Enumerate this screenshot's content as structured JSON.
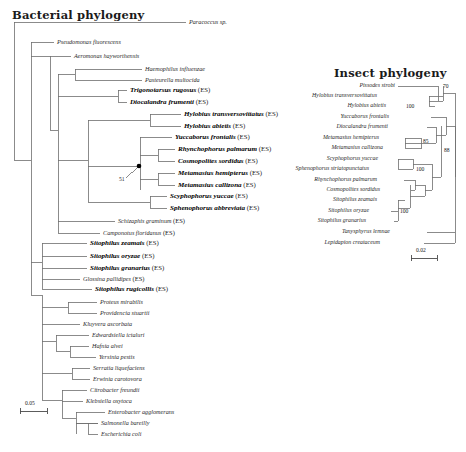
{
  "figure": {
    "bacterial": {
      "title": "Bacterial phylogeny",
      "scale": "0.05",
      "support_labels": [
        {
          "id": "n51",
          "value": "51"
        }
      ],
      "tips": [
        {
          "name": "Paracoccus sp.",
          "suffix": "",
          "bold": false,
          "x": 189,
          "y": 22
        },
        {
          "name": "Pseudomonas fluorescens",
          "suffix": "",
          "bold": false,
          "x": 57,
          "y": 42
        },
        {
          "name": "Aeromonas hayworthensis",
          "suffix": "",
          "bold": false,
          "x": 74,
          "y": 56
        },
        {
          "name": "Haemophilus influenzae",
          "suffix": "",
          "bold": false,
          "x": 145,
          "y": 69
        },
        {
          "name": "Pasteurella multocida",
          "suffix": "",
          "bold": false,
          "x": 145,
          "y": 80
        },
        {
          "name": "Trigonotarsus rugosus",
          "suffix": "(ES)",
          "bold": true,
          "x": 130,
          "y": 90
        },
        {
          "name": "Diocalandra frumenti",
          "suffix": "(ES)",
          "bold": true,
          "x": 130,
          "y": 102
        },
        {
          "name": "Hylobius transversovittatus",
          "suffix": "(ES)",
          "bold": true,
          "x": 184,
          "y": 114
        },
        {
          "name": "Hylobius abietis",
          "suffix": "(ES)",
          "bold": true,
          "x": 184,
          "y": 126
        },
        {
          "name": "Yuccaborus frontalis",
          "suffix": "(ES)",
          "bold": true,
          "x": 175,
          "y": 137
        },
        {
          "name": "Rhynchophorus palmarum",
          "suffix": "(ES)",
          "bold": true,
          "x": 178,
          "y": 149
        },
        {
          "name": "Cosmopolites sordidus",
          "suffix": "(ES)",
          "bold": true,
          "x": 178,
          "y": 161
        },
        {
          "name": "Metamasius hemipterus",
          "suffix": "(ES)",
          "bold": true,
          "x": 178,
          "y": 173
        },
        {
          "name": "Metamasius callizona",
          "suffix": "(ES)",
          "bold": true,
          "x": 178,
          "y": 185
        },
        {
          "name": "Scyphophorus yuccae",
          "suffix": "(ES)",
          "bold": true,
          "x": 170,
          "y": 196
        },
        {
          "name": "Sphenophorus abbreviata",
          "suffix": "(ES)",
          "bold": true,
          "x": 170,
          "y": 208
        },
        {
          "name": "Schizaphis graminum",
          "suffix": "(ES)",
          "bold": false,
          "x": 118,
          "y": 221
        },
        {
          "name": "Camponotus floridanus",
          "suffix": "(ES)",
          "bold": false,
          "x": 103,
          "y": 233
        },
        {
          "name": "Sitophilus zeamais",
          "suffix": "(ES)",
          "bold": true,
          "x": 90,
          "y": 243
        },
        {
          "name": "Sitophilus oryzae",
          "suffix": "(ES)",
          "bold": true,
          "x": 90,
          "y": 256
        },
        {
          "name": "Sitophilus granarius",
          "suffix": "(ES)",
          "bold": true,
          "x": 90,
          "y": 268
        },
        {
          "name": "Glossina pallidipes",
          "suffix": "(ES)",
          "bold": false,
          "x": 83,
          "y": 279
        },
        {
          "name": "Sitophilus rugicollis",
          "suffix": "(ES)",
          "bold": true,
          "x": 95,
          "y": 289
        },
        {
          "name": "Proteus mirabilis",
          "suffix": "",
          "bold": false,
          "x": 100,
          "y": 302
        },
        {
          "name": "Providencia stuartii",
          "suffix": "",
          "bold": false,
          "x": 100,
          "y": 313
        },
        {
          "name": "Kluyvera ascorbata",
          "suffix": "",
          "bold": false,
          "x": 83,
          "y": 324
        },
        {
          "name": "Edwardsiella ictaluri",
          "suffix": "",
          "bold": false,
          "x": 92,
          "y": 335
        },
        {
          "name": "Hafnia alvei",
          "suffix": "",
          "bold": false,
          "x": 92,
          "y": 346
        },
        {
          "name": "Yersinia pestis",
          "suffix": "",
          "bold": false,
          "x": 99,
          "y": 357
        },
        {
          "name": "Serratia liquefaciens",
          "suffix": "",
          "bold": false,
          "x": 93,
          "y": 368
        },
        {
          "name": "Erwinia carotovora",
          "suffix": "",
          "bold": false,
          "x": 93,
          "y": 379
        },
        {
          "name": "Citrobacter freundii",
          "suffix": "",
          "bold": false,
          "x": 90,
          "y": 390
        },
        {
          "name": "Klebsiella oxytoca",
          "suffix": "",
          "bold": false,
          "x": 86,
          "y": 401
        },
        {
          "name": "Enterobacter agglomerans",
          "suffix": "",
          "bold": false,
          "x": 108,
          "y": 412
        },
        {
          "name": "Salmonella bareilly",
          "suffix": "",
          "bold": false,
          "x": 101,
          "y": 423
        },
        {
          "name": "Escherichia coli",
          "suffix": "",
          "bold": false,
          "x": 101,
          "y": 434
        }
      ]
    },
    "insect": {
      "title": "Insect phylogeny",
      "scale": "0.02",
      "support_labels": [
        {
          "id": "i70",
          "value": "70"
        },
        {
          "id": "i100a",
          "value": "100"
        },
        {
          "id": "i85",
          "value": "85"
        },
        {
          "id": "i88",
          "value": "88"
        },
        {
          "id": "i100b",
          "value": "100"
        },
        {
          "id": "i100c",
          "value": "100"
        }
      ],
      "tips": [
        {
          "name": "Pissodes strobi",
          "x": 395,
          "y": 86
        },
        {
          "name": "Hylobius transversovittatus",
          "x": 377,
          "y": 96
        },
        {
          "name": "Hylobius abietis",
          "x": 386,
          "y": 106
        },
        {
          "name": "Diocalandra frumenti",
          "x": 388,
          "y": 127
        },
        {
          "name": "Yuccaborus frontalis",
          "x": 389,
          "y": 117
        },
        {
          "name": "Metamasius hemipterus",
          "x": 379,
          "y": 138
        },
        {
          "name": "Metamasius callizona",
          "x": 383,
          "y": 148
        },
        {
          "name": "Scyphophorus yuccae",
          "x": 378,
          "y": 159
        },
        {
          "name": "Sphenophorus striatopunctatus",
          "x": 369,
          "y": 169
        },
        {
          "name": "Rhynchophorus palmarum",
          "x": 377,
          "y": 180
        },
        {
          "name": "Cosmopolites sordidus",
          "x": 380,
          "y": 190
        },
        {
          "name": "Sitophilus zeamais",
          "x": 377,
          "y": 200
        },
        {
          "name": "Sitophilus oryzae",
          "x": 369,
          "y": 211
        },
        {
          "name": "Sitophilus granarius",
          "x": 366,
          "y": 221
        },
        {
          "name": "Tanysphyrus lemnae",
          "x": 390,
          "y": 232
        },
        {
          "name": "Lepidapion creataceum",
          "x": 380,
          "y": 243
        }
      ]
    }
  }
}
